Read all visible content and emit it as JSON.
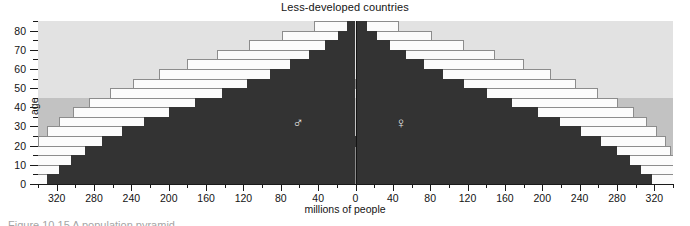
{
  "chart": {
    "title": "Less-developed countries",
    "xlabel": "millions of people",
    "ylabel": "age",
    "caption": "Figure 10.15  A population pyramid"
  },
  "symbols": {
    "male": "♂",
    "female": "♀",
    "male_name": "male-symbol",
    "female_name": "female-symbol"
  },
  "axes": {
    "y_ticks_major": [
      0,
      10,
      20,
      30,
      40,
      50,
      60,
      70,
      80
    ],
    "y_ticks_minor": [
      5,
      15,
      25,
      35,
      45,
      55,
      65,
      75,
      85
    ],
    "y_labels": [
      "0",
      "10",
      "20",
      "30",
      "40",
      "50",
      "60",
      "70",
      "80"
    ],
    "y_range": [
      0,
      85
    ],
    "x_ticks": [
      -320,
      -280,
      -240,
      -200,
      -160,
      -120,
      -80,
      -40,
      0,
      40,
      80,
      120,
      160,
      200,
      240,
      280,
      320
    ],
    "x_labels": [
      "320",
      "280",
      "240",
      "200",
      "160",
      "120",
      "80",
      "40",
      "0",
      "40",
      "80",
      "120",
      "160",
      "200",
      "240",
      "280",
      "320"
    ],
    "x_range": [
      -340,
      340
    ],
    "x_minor_step": 20
  },
  "bands": [
    {
      "name": "youth-band",
      "from": 0,
      "to": 15,
      "color": "#a8a8a8"
    },
    {
      "name": "working-age-band",
      "from": 15,
      "to": 45,
      "color": "#c2c2c2"
    },
    {
      "name": "older-band",
      "from": 45,
      "to": 85,
      "color": "#e2e2e2"
    }
  ],
  "colors": {
    "current_fill": "#333333",
    "projected_fill": "#fbfbfb",
    "projected_outline": "#8c8c8c",
    "centerline": "#141414",
    "plot_background": "#e8e8e8"
  },
  "chart_data": {
    "type": "bar",
    "orientation": "population-pyramid",
    "title": "Less-developed countries",
    "xlabel": "millions of people",
    "ylabel": "age",
    "xlim": [
      -340,
      340
    ],
    "ylim": [
      0,
      85
    ],
    "grid": false,
    "legend": "none",
    "age_groups": [
      "0-4",
      "5-9",
      "10-14",
      "15-19",
      "20-24",
      "25-29",
      "30-34",
      "35-39",
      "40-44",
      "45-49",
      "50-54",
      "55-59",
      "60-64",
      "65-69",
      "70-74",
      "75-79",
      "80+"
    ],
    "series": [
      {
        "name": "Male current",
        "side": "left",
        "fill": "#333333",
        "values": [
          330,
          318,
          305,
          290,
          272,
          250,
          226,
          200,
          172,
          143,
          116,
          92,
          70,
          50,
          33,
          19,
          9
        ]
      },
      {
        "name": "Female current",
        "side": "right",
        "fill": "#333333",
        "values": [
          318,
          306,
          294,
          280,
          263,
          242,
          219,
          195,
          168,
          141,
          116,
          94,
          73,
          54,
          37,
          23,
          12
        ]
      },
      {
        "name": "Male projected total",
        "side": "left",
        "fill": "#fbfbfb",
        "values": [
          358,
          356,
          352,
          347,
          340,
          330,
          318,
          303,
          285,
          263,
          238,
          210,
          180,
          148,
          114,
          79,
          44
        ]
      },
      {
        "name": "Female projected total",
        "side": "right",
        "fill": "#fbfbfb",
        "values": [
          348,
          346,
          343,
          338,
          332,
          323,
          312,
          298,
          281,
          260,
          236,
          209,
          180,
          149,
          116,
          82,
          47
        ]
      }
    ],
    "annotations": [
      {
        "name": "male-symbol",
        "text": "♂",
        "x": -60,
        "y": 32
      },
      {
        "name": "female-symbol",
        "text": "♀",
        "x": 50,
        "y": 32
      }
    ]
  }
}
